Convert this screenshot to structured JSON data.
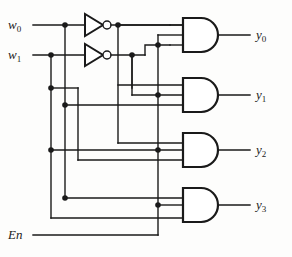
{
  "diagram": {
    "type": "logic-circuit",
    "width": 292,
    "height": 257,
    "colors": {
      "wire": "#1a1a1a",
      "gate_fill": "#ffffff",
      "gate_stroke": "#1a1a1a",
      "background": "#fdfdfc",
      "text": "#1a1a1a"
    }
  },
  "inputs": [
    {
      "id": "w0",
      "name": "w",
      "index": "0",
      "y": 25
    },
    {
      "id": "w1",
      "name": "w",
      "index": "1",
      "y": 55
    },
    {
      "id": "En",
      "name": "En",
      "index": "",
      "y": 235
    }
  ],
  "outputs": [
    {
      "id": "y0",
      "name": "y",
      "index": "0",
      "y": 35
    },
    {
      "id": "y1",
      "name": "y",
      "index": "1",
      "y": 95
    },
    {
      "id": "y2",
      "name": "y",
      "index": "2",
      "y": 150
    },
    {
      "id": "y3",
      "name": "y",
      "index": "3",
      "y": 205
    }
  ],
  "gates": {
    "inverters": [
      {
        "id": "inv0",
        "input": "w0",
        "output": "w0_bar"
      },
      {
        "id": "inv1",
        "input": "w1",
        "output": "w1_bar"
      }
    ],
    "and_gates": [
      {
        "id": "and0",
        "output": "y0",
        "inputs": [
          "w0_bar",
          "w1_bar",
          "En"
        ]
      },
      {
        "id": "and1",
        "output": "y1",
        "inputs": [
          "w0",
          "w1_bar",
          "En"
        ]
      },
      {
        "id": "and2",
        "output": "y2",
        "inputs": [
          "w0_bar",
          "w1",
          "En"
        ]
      },
      {
        "id": "and3",
        "output": "y3",
        "inputs": [
          "w0",
          "w1",
          "En"
        ]
      }
    ]
  },
  "labels": {
    "w0": "w",
    "w0_sub": "0",
    "w1": "w",
    "w1_sub": "1",
    "en": "En",
    "y0": "y",
    "y0_sub": "0",
    "y1": "y",
    "y1_sub": "1",
    "y2": "y",
    "y2_sub": "2",
    "y3": "y",
    "y3_sub": "3"
  }
}
